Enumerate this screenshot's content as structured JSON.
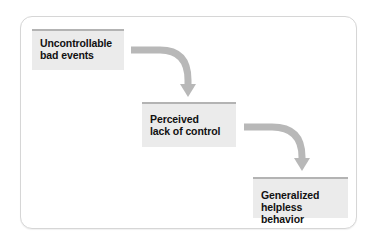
{
  "diagram": {
    "type": "flow",
    "nodes": [
      {
        "id": "n1",
        "lines": [
          "Uncontrollable",
          "bad events"
        ]
      },
      {
        "id": "n2",
        "lines": [
          "Perceived",
          "lack of control"
        ]
      },
      {
        "id": "n3",
        "lines": [
          "Generalized",
          "helpless behavior"
        ]
      }
    ],
    "edges": [
      {
        "from": "n1",
        "to": "n2"
      },
      {
        "from": "n2",
        "to": "n3"
      }
    ],
    "colors": {
      "box_fill": "#ebebeb",
      "box_top_border": "#b3b3b3",
      "arrow": "#b8b8b8",
      "frame_border": "#d6d6d6",
      "text": "#111111"
    }
  }
}
